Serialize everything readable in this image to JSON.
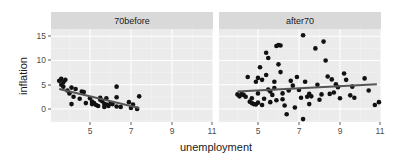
{
  "chart_data": {
    "type": "scatter",
    "facets": [
      "70before",
      "after70"
    ],
    "xlabel": "unemployment",
    "ylabel": "inflation",
    "xlim": [
      3.1,
      11.0
    ],
    "ylim": [
      -2.7,
      16.5
    ],
    "xticks": [
      5,
      7,
      9,
      11
    ],
    "yticks": [
      0,
      5,
      10,
      15
    ],
    "grid": true,
    "smooth": "linear",
    "panels": [
      {
        "name": "70before",
        "fit": {
          "x0": 3.5,
          "y0": 4.1,
          "x1": 7.4,
          "y1": 0.2
        },
        "points": [
          [
            3.5,
            5.8
          ],
          [
            3.6,
            6.2
          ],
          [
            3.6,
            5.0
          ],
          [
            3.7,
            5.5
          ],
          [
            3.7,
            4.6
          ],
          [
            3.8,
            6.0
          ],
          [
            3.9,
            3.8
          ],
          [
            4.0,
            3.2
          ],
          [
            4.1,
            4.4
          ],
          [
            4.1,
            1.0
          ],
          [
            4.2,
            2.5
          ],
          [
            4.3,
            4.1
          ],
          [
            4.5,
            2.1
          ],
          [
            4.6,
            3.6
          ],
          [
            4.7,
            3.5
          ],
          [
            4.8,
            1.2
          ],
          [
            5.0,
            2.2
          ],
          [
            5.1,
            1.5
          ],
          [
            5.1,
            1.0
          ],
          [
            5.2,
            1.2
          ],
          [
            5.3,
            0.8
          ],
          [
            5.4,
            0.6
          ],
          [
            5.5,
            2.3
          ],
          [
            5.5,
            1.9
          ],
          [
            5.6,
            1.6
          ],
          [
            5.7,
            0.4
          ],
          [
            5.7,
            1.0
          ],
          [
            5.8,
            2.2
          ],
          [
            5.8,
            0.9
          ],
          [
            5.9,
            0.6
          ],
          [
            6.0,
            1.1
          ],
          [
            6.1,
            1.0
          ],
          [
            6.3,
            4.6
          ],
          [
            6.3,
            2.4
          ],
          [
            6.3,
            0.5
          ],
          [
            6.5,
            0.4
          ],
          [
            6.9,
            1.4
          ],
          [
            7.0,
            0.2
          ],
          [
            7.1,
            0.9
          ],
          [
            7.3,
            0.0
          ],
          [
            7.4,
            2.6
          ]
        ]
      },
      {
        "name": "after70",
        "fit": {
          "x0": 4.0,
          "y0": 3.6,
          "x1": 10.8,
          "y1": 5.1
        },
        "points": [
          [
            4.0,
            3.0
          ],
          [
            4.1,
            2.6
          ],
          [
            4.2,
            3.1
          ],
          [
            4.3,
            2.9
          ],
          [
            4.4,
            2.5
          ],
          [
            4.5,
            6.6
          ],
          [
            4.6,
            1.5
          ],
          [
            4.7,
            1.2
          ],
          [
            4.7,
            2.2
          ],
          [
            4.8,
            1.0
          ],
          [
            4.9,
            0.9
          ],
          [
            5.0,
            1.3
          ],
          [
            5.0,
            3.2
          ],
          [
            4.9,
            5.6
          ],
          [
            5.0,
            6.4
          ],
          [
            5.1,
            8.6
          ],
          [
            5.2,
            6.0
          ],
          [
            5.3,
            2.1
          ],
          [
            5.2,
            0.8
          ],
          [
            5.4,
            11.6
          ],
          [
            5.5,
            10.5
          ],
          [
            5.4,
            7.0
          ],
          [
            5.5,
            4.0
          ],
          [
            5.6,
            3.6
          ],
          [
            5.6,
            1.4
          ],
          [
            5.7,
            2.9
          ],
          [
            5.8,
            4.3
          ],
          [
            5.8,
            5.6
          ],
          [
            5.9,
            1.8
          ],
          [
            5.9,
            13.0
          ],
          [
            6.0,
            13.2
          ],
          [
            6.1,
            13.1
          ],
          [
            6.0,
            9.2
          ],
          [
            6.1,
            7.6
          ],
          [
            6.2,
            3.2
          ],
          [
            6.2,
            2.0
          ],
          [
            6.3,
            0.7
          ],
          [
            6.4,
            -1.1
          ],
          [
            6.5,
            3.8
          ],
          [
            6.6,
            5.8
          ],
          [
            6.7,
            4.8
          ],
          [
            6.8,
            0.3
          ],
          [
            6.9,
            6.6
          ],
          [
            7.0,
            3.9
          ],
          [
            7.1,
            2.3
          ],
          [
            7.2,
            15.2
          ],
          [
            7.3,
            5.6
          ],
          [
            7.4,
            2.5
          ],
          [
            7.5,
            1.0
          ],
          [
            7.5,
            3.1
          ],
          [
            7.6,
            2.6
          ],
          [
            7.8,
            12.5
          ],
          [
            7.9,
            5.0
          ],
          [
            8.0,
            1.9
          ],
          [
            8.1,
            3.0
          ],
          [
            8.2,
            13.9
          ],
          [
            8.3,
            10.0
          ],
          [
            8.4,
            6.7
          ],
          [
            8.5,
            3.1
          ],
          [
            8.6,
            6.1
          ],
          [
            8.7,
            3.4
          ],
          [
            8.8,
            5.1
          ],
          [
            8.9,
            4.5
          ],
          [
            9.0,
            2.2
          ],
          [
            9.2,
            7.3
          ],
          [
            9.3,
            6.0
          ],
          [
            9.5,
            2.8
          ],
          [
            9.6,
            4.6
          ],
          [
            9.7,
            2.3
          ],
          [
            10.2,
            6.3
          ],
          [
            10.4,
            3.8
          ],
          [
            10.7,
            0.8
          ],
          [
            10.9,
            1.4
          ],
          [
            7.2,
            -2.1
          ]
        ]
      }
    ]
  },
  "labels": {
    "strip_left": "70before",
    "strip_right": "after70",
    "xlabel": "unemployment",
    "ylabel": "inflation",
    "yticks": [
      "15",
      "10",
      "5",
      "0"
    ],
    "xticks_left": [
      "5",
      "7",
      "9",
      "11"
    ],
    "xticks_right": [
      "5",
      "7",
      "9",
      "11"
    ]
  },
  "colors": {
    "panel_bg": "#ebebeb",
    "strip_bg": "#d9d9d9",
    "grid_major": "#ffffff",
    "point": "#111111",
    "fit_line": "#555555",
    "text": "#4d4d4d",
    "title": "#1a1a1a"
  }
}
